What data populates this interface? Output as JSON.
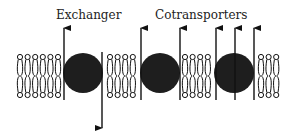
{
  "labels": {
    "exchanger": "Exchanger",
    "cotransporters": "Cotransporters"
  },
  "colors": {
    "ink": "#111111",
    "protein": "#1e1e1e",
    "background": "#ffffff"
  },
  "membrane": {
    "head_top_y": 57,
    "head_bottom_y": 95,
    "lipid_groups": [
      {
        "x_start": 20,
        "count": 6,
        "spacing": 7.6
      },
      {
        "x_start": 110,
        "count": 4,
        "spacing": 7.6
      },
      {
        "x_start": 185,
        "count": 4,
        "spacing": 7.6
      },
      {
        "x_start": 261,
        "count": 3,
        "spacing": 7.6
      }
    ]
  },
  "proteins": [
    {
      "name": "exchanger",
      "cx": 83,
      "cy": 73,
      "r": 20
    },
    {
      "name": "cotransporter-1",
      "cx": 160,
      "cy": 73,
      "r": 20
    },
    {
      "name": "cotransporter-2",
      "cx": 234,
      "cy": 73,
      "r": 20
    }
  ],
  "arrows": [
    {
      "x": 64,
      "y_from": 100,
      "y_to": 28,
      "direction": "up"
    },
    {
      "x": 102,
      "y_from": 52,
      "y_to": 128,
      "direction": "down"
    },
    {
      "x": 141,
      "y_from": 100,
      "y_to": 28,
      "direction": "up"
    },
    {
      "x": 180,
      "y_from": 100,
      "y_to": 28,
      "direction": "up"
    },
    {
      "x": 216,
      "y_from": 100,
      "y_to": 28,
      "direction": "up"
    },
    {
      "x": 235,
      "y_from": 100,
      "y_to": 28,
      "direction": "up"
    },
    {
      "x": 254,
      "y_from": 100,
      "y_to": 28,
      "direction": "up"
    }
  ]
}
